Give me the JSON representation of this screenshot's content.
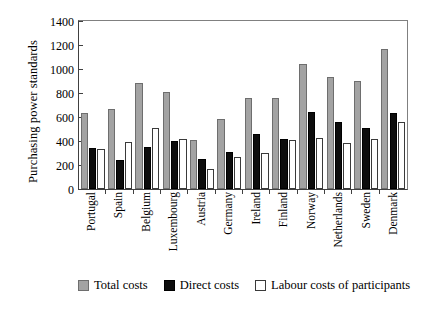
{
  "chart_data": {
    "type": "bar",
    "title": "",
    "xlabel": "",
    "ylabel": "Purchasing power standards",
    "ylim": [
      0,
      1400
    ],
    "ytick_step": 200,
    "yticks": [
      1400,
      1200,
      1000,
      800,
      600,
      400,
      200,
      0
    ],
    "grid": false,
    "legend_position": "bottom",
    "categories": [
      "Portugal",
      "Spain",
      "Belgium",
      "Luxembourg",
      "Austria",
      "Germany",
      "Ireland",
      "Finland",
      "Norway",
      "Netherlands",
      "Sweden",
      "Denmark"
    ],
    "series": [
      {
        "name": "Total costs",
        "color": "#a3a3a3",
        "values": [
          635,
          670,
          880,
          805,
          410,
          580,
          760,
          755,
          1045,
          930,
          900,
          1170
        ]
      },
      {
        "name": "Direct costs",
        "color": "#0d0d0d",
        "values": [
          340,
          240,
          350,
          400,
          250,
          310,
          455,
          415,
          640,
          560,
          510,
          635
        ]
      },
      {
        "name": "Labour costs of participants",
        "color": "#ffffff",
        "values": [
          330,
          390,
          505,
          415,
          165,
          270,
          300,
          410,
          425,
          385,
          420,
          560
        ]
      }
    ]
  },
  "legend": {
    "items": [
      {
        "label": "Total costs",
        "swatch": "total-costs-swatch"
      },
      {
        "label": "Direct costs",
        "swatch": "direct-costs-swatch"
      },
      {
        "label": "Labour costs of participants",
        "swatch": "labour-costs-swatch"
      }
    ]
  }
}
